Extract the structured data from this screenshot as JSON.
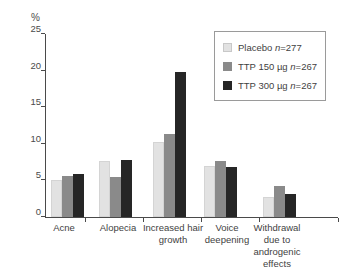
{
  "chart_data": {
    "type": "bar",
    "title": "",
    "ylabel": "%",
    "xlabel": "",
    "ylim": [
      0,
      25
    ],
    "yticks": [
      0,
      5,
      10,
      15,
      20,
      25
    ],
    "grid": false,
    "legend_position": "top-right",
    "categories": [
      {
        "lines": [
          "Acne"
        ]
      },
      {
        "lines": [
          "Alopecia"
        ]
      },
      {
        "lines": [
          "Increased hair",
          "growth"
        ]
      },
      {
        "lines": [
          "Voice",
          "deepening"
        ]
      },
      {
        "lines": [
          "Withdrawal",
          "due to",
          "androgenic",
          "effects"
        ]
      }
    ],
    "series": [
      {
        "label_prefix": "Placebo ",
        "n_symbol": "n",
        "n_value": "=277",
        "color": "#e2e2e2",
        "values": [
          5.0,
          7.7,
          10.3,
          7.0,
          2.7
        ]
      },
      {
        "label_prefix": "TTP 150 µg ",
        "n_symbol": "n",
        "n_value": "=267",
        "color": "#8a8a8a",
        "values": [
          5.6,
          5.5,
          11.4,
          7.7,
          4.3
        ]
      },
      {
        "label_prefix": "TTP 300 µg ",
        "n_symbol": "n",
        "n_value": "=267",
        "color": "#262626",
        "values": [
          5.9,
          7.8,
          19.8,
          6.9,
          3.2
        ]
      }
    ]
  }
}
